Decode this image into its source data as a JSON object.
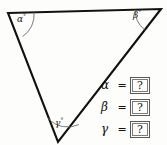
{
  "figure": {
    "type": "triangle-angle-diagram",
    "background_color": "#fdfdfc",
    "stroke_color": "#111111",
    "arc_color": "#6b6b6b",
    "vertices": {
      "top_left": {
        "x": 8,
        "y": 13
      },
      "top_right": {
        "x": 161,
        "y": 9
      },
      "bottom": {
        "x": 58,
        "y": 142
      }
    },
    "angles": [
      {
        "id": "alpha",
        "label": "α",
        "degree_mark": "°",
        "vertex": "top_left"
      },
      {
        "id": "beta",
        "label": "β",
        "degree_mark": "°",
        "vertex": "top_right"
      },
      {
        "id": "gamma",
        "label": "γ",
        "degree_mark": "°",
        "vertex": "bottom"
      }
    ]
  },
  "equations": {
    "equals_sign": "=",
    "rows": [
      {
        "symbol": "α",
        "value": "?"
      },
      {
        "symbol": "β",
        "value": "?"
      },
      {
        "symbol": "γ",
        "value": "?"
      }
    ]
  }
}
